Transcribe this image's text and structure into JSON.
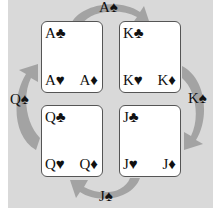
{
  "colors": {
    "background": "#d9d9d9",
    "arrow": "#9e9e9e",
    "card": "#ffffff",
    "text": "#111111"
  },
  "cards": [
    {
      "id": "ace",
      "top_left": "A♣",
      "bottom_left": "A♥",
      "bottom_right": "A♦"
    },
    {
      "id": "king",
      "top_left": "K♣",
      "bottom_left": "K♥",
      "bottom_right": "K♦"
    },
    {
      "id": "queen",
      "top_left": "Q♣",
      "bottom_left": "Q♥",
      "bottom_right": "Q♦"
    },
    {
      "id": "jack",
      "top_left": "J♣",
      "bottom_left": "J♥",
      "bottom_right": "J♦"
    }
  ],
  "arrow_labels": {
    "top": "A♠",
    "right": "K♠",
    "bottom": "J♠",
    "left": "Q♠"
  }
}
